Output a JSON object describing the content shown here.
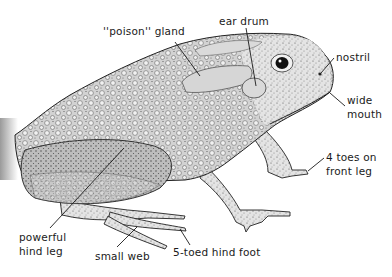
{
  "figure": {
    "style": "stippled pen illustration",
    "colors": {
      "background": "#ffffff",
      "ink": "#1a1a1a",
      "skin_light": "#e6e6e6",
      "skin_mid": "#c9c9c9",
      "skin_dark": "#9e9e9e"
    }
  },
  "labels": [
    {
      "id": "poison-gland",
      "lines": [
        "''poison'' gland"
      ],
      "x": 103,
      "y": 24,
      "leader": {
        "x1": 175,
        "y1": 42,
        "x2": 200,
        "y2": 76
      }
    },
    {
      "id": "ear-drum",
      "lines": [
        "ear drum"
      ],
      "x": 219,
      "y": 14,
      "leader": {
        "x1": 246,
        "y1": 28,
        "x2": 256,
        "y2": 86
      }
    },
    {
      "id": "nostril",
      "lines": [
        "nostril"
      ],
      "x": 336,
      "y": 50,
      "leader": {
        "x1": 334,
        "y1": 58,
        "x2": 321,
        "y2": 73
      }
    },
    {
      "id": "wide-mouth",
      "lines": [
        "wide",
        "mouth"
      ],
      "x": 347,
      "y": 93,
      "leader": {
        "x1": 345,
        "y1": 106,
        "x2": 330,
        "y2": 93
      }
    },
    {
      "id": "front-toes",
      "lines": [
        "4 toes on",
        "front leg"
      ],
      "x": 326,
      "y": 150,
      "leader": {
        "x1": 324,
        "y1": 158,
        "x2": 308,
        "y2": 171
      }
    },
    {
      "id": "hind-leg",
      "lines": [
        "powerful",
        "hind leg"
      ],
      "x": 19,
      "y": 230,
      "leader": {
        "x1": 50,
        "y1": 228,
        "x2": 124,
        "y2": 148
      }
    },
    {
      "id": "small-web",
      "lines": [
        "small web"
      ],
      "x": 95,
      "y": 249,
      "leader": {
        "x1": 117,
        "y1": 247,
        "x2": 137,
        "y2": 227
      }
    },
    {
      "id": "hind-foot",
      "lines": [
        "5-toed hind foot"
      ],
      "x": 173,
      "y": 245,
      "leader": {
        "x1": 190,
        "y1": 245,
        "x2": 180,
        "y2": 229
      }
    }
  ]
}
